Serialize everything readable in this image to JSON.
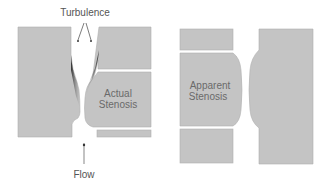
{
  "diagram": {
    "left_panel": {
      "turbulence_label": "Turbulence",
      "actual_label_line1": "Actual",
      "actual_label_line2": "Stenosis",
      "flow_label": "Flow"
    },
    "right_panel": {
      "apparent_label_line1": "Apparent",
      "apparent_label_line2": "Stenosis"
    },
    "colors": {
      "wall": "#c4c4c4",
      "wall_edge": "#a8a8a8",
      "turbulence": "#3a3a3a",
      "text": "#555555"
    }
  }
}
